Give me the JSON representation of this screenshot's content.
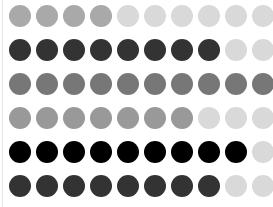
{
  "layout": {
    "columns": 10,
    "rows": 6,
    "first_center_x": 20,
    "first_center_y": 16,
    "col_spacing": 27,
    "row_spacing": 34,
    "diameter": 22
  },
  "colors": {
    "light": "#d9d9d9",
    "medium_gray": "#a9a9a9",
    "gray": "#999999",
    "mid_dark": "#777777",
    "dark": "#333333",
    "black": "#000000"
  },
  "rows": [
    {
      "filled": 4,
      "fill_color": "#a9a9a9",
      "empty_color": "#d9d9d9"
    },
    {
      "filled": 8,
      "fill_color": "#333333",
      "empty_color": "#d9d9d9"
    },
    {
      "filled": 10,
      "fill_color": "#777777",
      "empty_color": "#d9d9d9"
    },
    {
      "filled": 7,
      "fill_color": "#999999",
      "empty_color": "#d9d9d9"
    },
    {
      "filled": 9,
      "fill_color": "#000000",
      "empty_color": "#d9d9d9"
    },
    {
      "filled": 8,
      "fill_color": "#333333",
      "empty_color": "#d9d9d9"
    }
  ]
}
